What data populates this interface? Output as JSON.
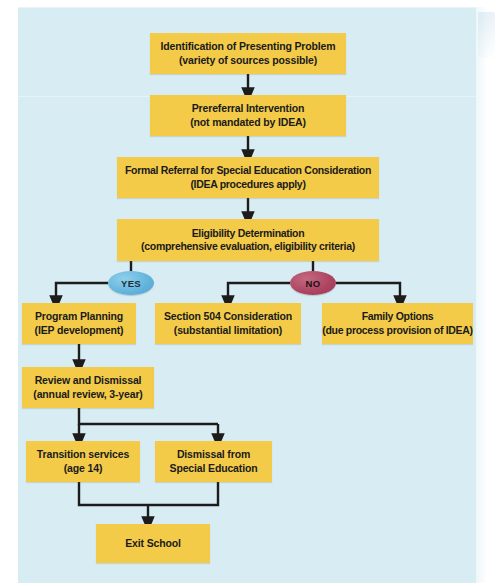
{
  "figure": {
    "kind": "flowchart",
    "background_color": "#d7ecf3",
    "node_color": "#f3cb48",
    "yes_color": "#63b4dc",
    "no_color": "#ad4462",
    "connector_color": "#1c1c1c"
  },
  "nodes": {
    "identification": {
      "line1": "Identification of Presenting Problem",
      "line2": "(variety of sources possible)"
    },
    "prereferral": {
      "line1": "Prereferral Intervention",
      "line2": "(not mandated by IDEA)"
    },
    "formal_referral": {
      "line1": "Formal Referral for Special Education Consideration",
      "line2": "(IDEA procedures apply)"
    },
    "eligibility": {
      "line1": "Eligibility Determination",
      "line2": "(comprehensive evaluation, eligibility criteria)"
    },
    "program_planning": {
      "line1": "Program Planning",
      "line2": "(IEP development)"
    },
    "section_504": {
      "line1": "Section 504 Consideration",
      "line2": "(substantial limitation)"
    },
    "family_options": {
      "line1": "Family Options",
      "line2": "(due process provision of IDEA)"
    },
    "review_dismissal": {
      "line1": "Review and Dismissal",
      "line2": "(annual review, 3-year)"
    },
    "transition_services": {
      "line1": "Transition services",
      "line2": "(age 14)"
    },
    "dismissal_spec_ed": {
      "line1": "Dismissal from",
      "line2": "Special Education"
    },
    "exit_school": {
      "line1": "Exit School",
      "line2": ""
    }
  },
  "decisions": {
    "yes": "YES",
    "no": "NO"
  },
  "edges": [
    {
      "from": "identification",
      "to": "prereferral",
      "label": ""
    },
    {
      "from": "prereferral",
      "to": "formal_referral",
      "label": ""
    },
    {
      "from": "formal_referral",
      "to": "eligibility",
      "label": ""
    },
    {
      "from": "eligibility",
      "to": "program_planning",
      "label": "YES"
    },
    {
      "from": "eligibility",
      "to": "section_504",
      "label": "NO"
    },
    {
      "from": "eligibility",
      "to": "family_options",
      "label": "NO"
    },
    {
      "from": "program_planning",
      "to": "review_dismissal",
      "label": ""
    },
    {
      "from": "review_dismissal",
      "to": "transition_services",
      "label": ""
    },
    {
      "from": "review_dismissal",
      "to": "dismissal_spec_ed",
      "label": ""
    },
    {
      "from": "transition_services",
      "to": "exit_school",
      "label": ""
    },
    {
      "from": "dismissal_spec_ed",
      "to": "exit_school",
      "label": ""
    }
  ]
}
